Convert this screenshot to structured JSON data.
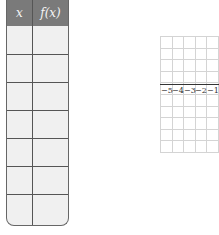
{
  "table": {
    "headers": [
      "x",
      "f(x)"
    ],
    "rows": [
      [
        "",
        ""
      ],
      [
        "",
        ""
      ],
      [
        "",
        ""
      ],
      [
        "",
        ""
      ],
      [
        "",
        ""
      ],
      [
        "",
        ""
      ],
      [
        "",
        ""
      ]
    ]
  },
  "graph": {
    "x_tick_labels": [
      "−5",
      "−4",
      "−3",
      "−2",
      "−1"
    ],
    "grid_color": "#d4d4d4",
    "axis_color": "#333333"
  }
}
